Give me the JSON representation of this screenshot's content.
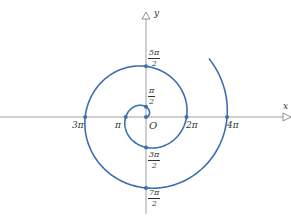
{
  "figure": {
    "axes": {
      "x_label": "x",
      "y_label": "y",
      "origin_label": "O"
    },
    "colors": {
      "curve": "#3a6fb0",
      "axis": "#777777",
      "text": "#333333"
    },
    "x_axis_points": [
      {
        "label": "3π",
        "theta": "3π"
      },
      {
        "label": "π",
        "theta": "π"
      },
      {
        "label": "2π",
        "theta": "2π"
      },
      {
        "label": "4π",
        "theta": "4π"
      }
    ],
    "y_axis_points": [
      {
        "num": "5π",
        "den": "2",
        "theta": "5π/2"
      },
      {
        "num": "π",
        "den": "2",
        "theta": "π/2"
      },
      {
        "num": "3π",
        "den": "2",
        "theta": "3π/2"
      },
      {
        "num": "7π",
        "den": "2",
        "theta": "7π/2"
      }
    ]
  }
}
